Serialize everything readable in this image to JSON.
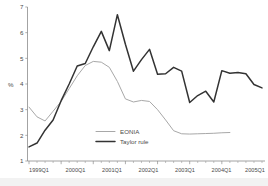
{
  "chart_data": {
    "type": "line",
    "title": "",
    "subtitle": "",
    "xlabel": "",
    "ylabel": "%",
    "ylim": [
      1,
      7
    ],
    "yticks": [
      1,
      2,
      3,
      4,
      5,
      6,
      7
    ],
    "ytick_labels": [
      "1",
      "2",
      "3",
      "4",
      "5",
      "6",
      "7"
    ],
    "grid": false,
    "legend_position": "inside-center-bottom",
    "x": [
      "1999Q1",
      "1999Q2",
      "1999Q3",
      "1999Q4",
      "2000Q1",
      "2000Q2",
      "2000Q3",
      "2000Q4",
      "2001Q1",
      "2001Q2",
      "2001Q3",
      "2001Q4",
      "2002Q1",
      "2002Q2",
      "2002Q3",
      "2002Q4",
      "2003Q1",
      "2003Q2",
      "2003Q3",
      "2003Q4",
      "2004Q1",
      "2004Q2",
      "2004Q3",
      "2004Q4",
      "2005Q1",
      "2005Q2"
    ],
    "xtick_labels": [
      "1999Q1",
      "2000Q1",
      "2001Q1",
      "2002Q1",
      "2003Q1",
      "2004Q1",
      "2005Q1"
    ],
    "xtick_indices": [
      0,
      4,
      8,
      12,
      16,
      20,
      24
    ],
    "minor_ticks_per_interval": 4,
    "series": [
      {
        "name": "EONIA",
        "color": "#a8a8a8",
        "width": 1.0,
        "values": [
          3.1,
          2.72,
          2.56,
          2.94,
          3.32,
          3.82,
          4.32,
          4.72,
          4.88,
          4.85,
          4.65,
          4.1,
          3.42,
          3.3,
          3.36,
          3.32,
          3.0,
          2.6,
          2.18,
          2.06,
          2.05,
          2.06,
          2.07,
          2.08,
          2.1,
          2.11
        ]
      },
      {
        "name": "Taylor rule",
        "color": "#333333",
        "width": 1.5,
        "values": [
          1.55,
          1.7,
          2.2,
          2.6,
          3.35,
          4.0,
          4.7,
          4.8,
          5.45,
          6.05,
          5.3,
          6.7,
          5.55,
          4.5,
          4.95,
          5.35,
          4.38,
          4.4,
          4.65,
          4.5,
          3.28,
          3.55,
          3.72,
          3.3,
          4.52,
          4.42
        ]
      }
    ],
    "series_extra_tail": {
      "Taylor rule": [
        4.45,
        4.4,
        3.98,
        3.85
      ]
    }
  },
  "legend": {
    "entries": [
      {
        "label": "EONIA",
        "color": "#a8a8a8"
      },
      {
        "label": "Taylor rule",
        "color": "#333333"
      }
    ]
  },
  "axes": {
    "y_axis_title": "%",
    "y_tick_labels": [
      "1",
      "2",
      "3",
      "4",
      "5",
      "6",
      "7"
    ],
    "x_tick_labels": [
      "1999Q1",
      "2000Q1",
      "2001Q1",
      "2002Q1",
      "2003Q1",
      "2004Q1",
      "2005Q1"
    ]
  }
}
